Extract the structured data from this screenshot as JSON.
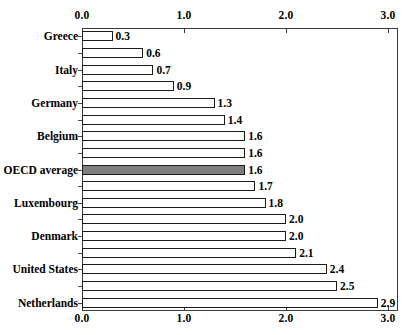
{
  "chart_data": {
    "type": "bar",
    "orientation": "horizontal",
    "title": "",
    "xlabel": "",
    "ylabel": "",
    "xlim": [
      0.0,
      3.0
    ],
    "xticks": [
      "0.0",
      "1.0",
      "2.0",
      "3.0"
    ],
    "xtick_values": [
      0.0,
      1.0,
      2.0,
      3.0
    ],
    "grid": false,
    "legend": "none",
    "axis_label_position": "top-and-bottom",
    "highlight_color": "#7f7f7f",
    "bar_color": "#ffffff",
    "bar_edge_color": "#1a1a1a",
    "categories": [
      "Greece",
      "",
      "Italy",
      "",
      "Germany",
      "",
      "Belgium",
      "",
      "OECD average",
      "",
      "Luxembourg",
      "",
      "Denmark",
      "",
      "United States",
      "",
      "Netherlands"
    ],
    "values": [
      0.3,
      0.6,
      0.7,
      0.9,
      1.3,
      1.4,
      1.6,
      1.6,
      1.6,
      1.7,
      1.8,
      2.0,
      2.0,
      2.1,
      2.4,
      2.5,
      2.9
    ],
    "value_labels": [
      "0.3",
      "0.6",
      "0.7",
      "0.9",
      "1.3",
      "1.4",
      "1.6",
      "1.6",
      "1.6",
      "1.7",
      "1.8",
      "2.0",
      "2.0",
      "2.1",
      "2.4",
      "2.5",
      "2.9"
    ],
    "highlighted_index": 8,
    "bars": [
      {
        "label": "Greece",
        "value": 0.3,
        "value_label": "0.3",
        "highlight": false
      },
      {
        "label": "",
        "value": 0.6,
        "value_label": "0.6",
        "highlight": false
      },
      {
        "label": "Italy",
        "value": 0.7,
        "value_label": "0.7",
        "highlight": false
      },
      {
        "label": "",
        "value": 0.9,
        "value_label": "0.9",
        "highlight": false
      },
      {
        "label": "Germany",
        "value": 1.3,
        "value_label": "1.3",
        "highlight": false
      },
      {
        "label": "",
        "value": 1.4,
        "value_label": "1.4",
        "highlight": false
      },
      {
        "label": "Belgium",
        "value": 1.6,
        "value_label": "1.6",
        "highlight": false
      },
      {
        "label": "",
        "value": 1.6,
        "value_label": "1.6",
        "highlight": false
      },
      {
        "label": "OECD average",
        "value": 1.6,
        "value_label": "1.6",
        "highlight": true
      },
      {
        "label": "",
        "value": 1.7,
        "value_label": "1.7",
        "highlight": false
      },
      {
        "label": "Luxembourg",
        "value": 1.8,
        "value_label": "1.8",
        "highlight": false
      },
      {
        "label": "",
        "value": 2.0,
        "value_label": "2.0",
        "highlight": false
      },
      {
        "label": "Denmark",
        "value": 2.0,
        "value_label": "2.0",
        "highlight": false
      },
      {
        "label": "",
        "value": 2.1,
        "value_label": "2.1",
        "highlight": false
      },
      {
        "label": "United States",
        "value": 2.4,
        "value_label": "2.4",
        "highlight": false
      },
      {
        "label": "",
        "value": 2.5,
        "value_label": "2.5",
        "highlight": false
      },
      {
        "label": "Netherlands",
        "value": 2.9,
        "value_label": "2.9",
        "highlight": false
      }
    ]
  }
}
